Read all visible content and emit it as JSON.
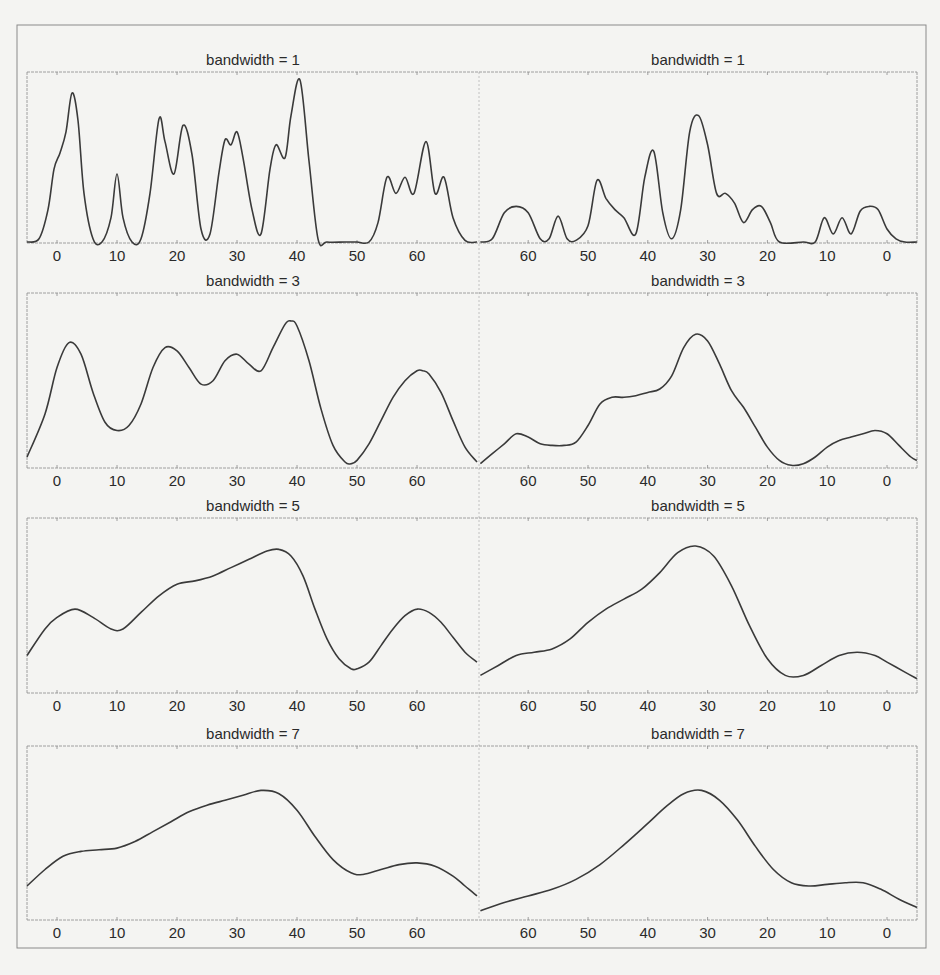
{
  "figure": {
    "line_color": "#3a3a3a",
    "frame_color": "#8a8a8a",
    "background": "#f4f4f2"
  },
  "chart_data": [
    {
      "type": "line",
      "panel": "left",
      "title": "bandwidth = 1",
      "xlabel": "",
      "ylabel": "",
      "xlim": [
        -5,
        70
      ],
      "x_ticks": [
        0,
        10,
        20,
        30,
        40,
        50,
        60
      ],
      "grid": false,
      "series": [
        {
          "name": "density",
          "x": [
            -5,
            -3,
            -1.5,
            -0.5,
            0.5,
            1.5,
            2.5,
            3.5,
            4.5,
            6,
            7.5,
            9,
            10,
            11,
            12.5,
            14,
            15.5,
            17,
            18,
            19.5,
            21,
            22.5,
            24,
            25.5,
            27,
            28,
            29,
            30,
            31,
            32.5,
            34,
            35.5,
            36.5,
            38,
            39,
            40.5,
            42,
            43.5,
            45,
            48,
            50,
            52,
            53.5,
            55,
            56.5,
            58,
            59.5,
            61.5,
            63,
            64.5,
            66,
            68,
            70
          ],
          "y": [
            0,
            0.02,
            0.2,
            0.45,
            0.55,
            0.68,
            0.92,
            0.75,
            0.3,
            0.02,
            0,
            0.15,
            0.42,
            0.15,
            0,
            0.02,
            0.3,
            0.76,
            0.62,
            0.42,
            0.72,
            0.54,
            0.08,
            0.05,
            0.43,
            0.63,
            0.6,
            0.68,
            0.52,
            0.2,
            0.05,
            0.45,
            0.6,
            0.52,
            0.78,
            1.0,
            0.5,
            0.02,
            0,
            0,
            0,
            0,
            0.12,
            0.4,
            0.3,
            0.4,
            0.3,
            0.62,
            0.3,
            0.4,
            0.15,
            0.01,
            0
          ]
        }
      ]
    },
    {
      "type": "line",
      "panel": "right",
      "title": "bandwidth = 1",
      "xlabel": "",
      "ylabel": "",
      "xlim": [
        68,
        -5
      ],
      "x_ticks": [
        60,
        50,
        40,
        30,
        20,
        10,
        0
      ],
      "grid": false,
      "series": [
        {
          "name": "density",
          "x": [
            68,
            66,
            64,
            62,
            60,
            58,
            56.5,
            55,
            53.5,
            52,
            50,
            48.5,
            47,
            45.5,
            44,
            42,
            40.5,
            39,
            37.5,
            36,
            34.5,
            33,
            31.5,
            30,
            28.5,
            27,
            25.5,
            24,
            22.5,
            21,
            19.5,
            18,
            14,
            12,
            10.5,
            9,
            7.5,
            6,
            4.5,
            3,
            1.5,
            0,
            -1.5,
            -3,
            -5
          ],
          "y": [
            0,
            0.02,
            0.18,
            0.22,
            0.18,
            0.02,
            0.02,
            0.16,
            0.02,
            0.01,
            0.1,
            0.38,
            0.27,
            0.2,
            0.15,
            0.05,
            0.4,
            0.56,
            0.18,
            0.02,
            0.2,
            0.68,
            0.78,
            0.6,
            0.3,
            0.3,
            0.24,
            0.12,
            0.2,
            0.22,
            0.12,
            0.0,
            0,
            0,
            0.15,
            0.05,
            0.15,
            0.05,
            0.19,
            0.22,
            0.2,
            0.08,
            0.02,
            0,
            0
          ]
        }
      ]
    },
    {
      "type": "line",
      "panel": "left",
      "title": "bandwidth = 3",
      "xlabel": "",
      "ylabel": "",
      "xlim": [
        -5,
        70
      ],
      "x_ticks": [
        0,
        10,
        20,
        30,
        40,
        50,
        60
      ],
      "grid": false,
      "series": [
        {
          "name": "density",
          "x": [
            -5,
            -2,
            0,
            2,
            4,
            6,
            8,
            10,
            12,
            14,
            16,
            18,
            20,
            22,
            24,
            26,
            28,
            30,
            32,
            34,
            36,
            38,
            39,
            40,
            42,
            44,
            46,
            48,
            49,
            50,
            52,
            54,
            56,
            58,
            60,
            61,
            62,
            64,
            66,
            68,
            70
          ],
          "y": [
            0.06,
            0.32,
            0.6,
            0.75,
            0.68,
            0.45,
            0.27,
            0.22,
            0.25,
            0.38,
            0.6,
            0.72,
            0.7,
            0.6,
            0.5,
            0.52,
            0.64,
            0.68,
            0.62,
            0.58,
            0.72,
            0.86,
            0.88,
            0.85,
            0.64,
            0.35,
            0.13,
            0.03,
            0.02,
            0.04,
            0.14,
            0.28,
            0.42,
            0.52,
            0.58,
            0.58,
            0.56,
            0.45,
            0.28,
            0.12,
            0.03
          ]
        }
      ]
    },
    {
      "type": "line",
      "panel": "right",
      "title": "bandwidth = 3",
      "xlabel": "",
      "ylabel": "",
      "xlim": [
        68,
        -5
      ],
      "x_ticks": [
        60,
        50,
        40,
        30,
        20,
        10,
        0
      ],
      "grid": false,
      "series": [
        {
          "name": "density",
          "x": [
            68,
            66,
            64,
            62,
            60,
            58,
            56,
            54,
            52,
            50,
            48,
            46,
            44,
            42,
            40,
            38,
            36,
            34,
            32,
            30,
            28,
            26,
            24,
            22,
            20,
            18,
            16,
            14,
            12,
            10,
            8,
            6,
            4,
            2,
            0,
            -2,
            -4,
            -5
          ],
          "y": [
            0.02,
            0.08,
            0.14,
            0.2,
            0.18,
            0.14,
            0.13,
            0.13,
            0.15,
            0.25,
            0.38,
            0.42,
            0.42,
            0.43,
            0.45,
            0.47,
            0.55,
            0.72,
            0.8,
            0.76,
            0.62,
            0.46,
            0.36,
            0.24,
            0.12,
            0.04,
            0.01,
            0.02,
            0.06,
            0.12,
            0.16,
            0.18,
            0.2,
            0.22,
            0.2,
            0.13,
            0.06,
            0.04
          ]
        }
      ]
    },
    {
      "type": "line",
      "panel": "left",
      "title": "bandwidth = 5",
      "xlabel": "",
      "ylabel": "",
      "xlim": [
        -5,
        70
      ],
      "x_ticks": [
        0,
        10,
        20,
        30,
        40,
        50,
        60
      ],
      "grid": false,
      "series": [
        {
          "name": "density",
          "x": [
            -5,
            -2,
            0,
            3,
            6,
            9,
            11,
            14,
            17,
            20,
            23,
            26,
            29,
            32,
            35,
            37,
            39,
            41,
            43,
            45,
            47,
            49,
            50,
            52,
            54,
            56,
            58,
            60,
            62,
            64,
            66,
            68,
            70
          ],
          "y": [
            0.22,
            0.38,
            0.45,
            0.5,
            0.45,
            0.38,
            0.38,
            0.48,
            0.58,
            0.65,
            0.67,
            0.7,
            0.75,
            0.8,
            0.85,
            0.86,
            0.82,
            0.7,
            0.5,
            0.32,
            0.2,
            0.14,
            0.14,
            0.18,
            0.28,
            0.38,
            0.46,
            0.5,
            0.48,
            0.42,
            0.33,
            0.24,
            0.18
          ]
        }
      ]
    },
    {
      "type": "line",
      "panel": "right",
      "title": "bandwidth = 5",
      "xlabel": "",
      "ylabel": "",
      "xlim": [
        68,
        -5
      ],
      "x_ticks": [
        60,
        50,
        40,
        30,
        20,
        10,
        0
      ],
      "grid": false,
      "series": [
        {
          "name": "density",
          "x": [
            68,
            65,
            62,
            59,
            56,
            53,
            50,
            47,
            44,
            41,
            38,
            35,
            32,
            29,
            26,
            23,
            20,
            17,
            14,
            11,
            8,
            5,
            2,
            0,
            -3,
            -5
          ],
          "y": [
            0.1,
            0.16,
            0.22,
            0.24,
            0.26,
            0.32,
            0.42,
            0.5,
            0.56,
            0.62,
            0.72,
            0.84,
            0.88,
            0.82,
            0.64,
            0.4,
            0.2,
            0.1,
            0.1,
            0.16,
            0.22,
            0.24,
            0.22,
            0.18,
            0.12,
            0.08
          ]
        }
      ]
    },
    {
      "type": "line",
      "panel": "left",
      "title": "bandwidth = 7",
      "xlabel": "",
      "ylabel": "",
      "xlim": [
        -5,
        70
      ],
      "x_ticks": [
        0,
        10,
        20,
        30,
        40,
        50,
        60
      ],
      "grid": false,
      "series": [
        {
          "name": "density",
          "x": [
            -5,
            -2,
            1,
            4,
            7,
            10,
            13,
            16,
            19,
            22,
            25,
            28,
            31,
            34,
            37,
            40,
            43,
            46,
            49,
            51,
            54,
            57,
            60,
            63,
            66,
            68,
            70
          ],
          "y": [
            0.2,
            0.3,
            0.38,
            0.41,
            0.42,
            0.43,
            0.47,
            0.53,
            0.59,
            0.65,
            0.69,
            0.72,
            0.75,
            0.78,
            0.76,
            0.66,
            0.5,
            0.36,
            0.28,
            0.27,
            0.3,
            0.33,
            0.34,
            0.32,
            0.26,
            0.2,
            0.14
          ]
        }
      ]
    },
    {
      "type": "line",
      "panel": "right",
      "title": "bandwidth = 7",
      "xlabel": "",
      "ylabel": "",
      "xlim": [
        68,
        -5
      ],
      "x_ticks": [
        60,
        50,
        40,
        30,
        20,
        10,
        0
      ],
      "grid": false,
      "series": [
        {
          "name": "density",
          "x": [
            68,
            64,
            60,
            56,
            52,
            48,
            44,
            40,
            37,
            34,
            31,
            28,
            25,
            22,
            19,
            16,
            13,
            10,
            7,
            4,
            1,
            -2,
            -5
          ],
          "y": [
            0.05,
            0.1,
            0.14,
            0.18,
            0.24,
            0.33,
            0.45,
            0.58,
            0.68,
            0.76,
            0.78,
            0.72,
            0.6,
            0.44,
            0.3,
            0.22,
            0.2,
            0.21,
            0.22,
            0.22,
            0.18,
            0.12,
            0.07
          ]
        }
      ]
    }
  ]
}
